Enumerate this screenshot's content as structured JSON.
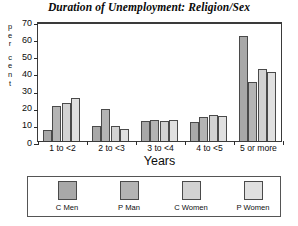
{
  "chart_data": {
    "type": "bar",
    "title": "Duration of Unemployment: Religion/Sex",
    "xlabel": "Years",
    "ylabel": "percent",
    "ylabel_letters": [
      "p",
      "e",
      "r",
      "",
      "c",
      "e",
      "n",
      "t"
    ],
    "categories": [
      "1 to <2",
      "2 to <3",
      "3 to <4",
      "4 to <5",
      "5 or more"
    ],
    "series": [
      {
        "name": "C Men",
        "color": "#a8a8a8",
        "values": [
          6.5,
          9.0,
          11.5,
          11.0,
          61.5
        ]
      },
      {
        "name": "P Men",
        "color": "#b4b4b4",
        "values": [
          20.5,
          18.5,
          12.0,
          14.0,
          34.5
        ]
      },
      {
        "name": "C Women",
        "color": "#d2d2d2",
        "values": [
          22.0,
          8.5,
          11.5,
          15.0,
          42.0
        ]
      },
      {
        "name": "P Women",
        "color": "#e0e0e0",
        "values": [
          25.0,
          7.0,
          12.0,
          14.5,
          40.0
        ]
      }
    ],
    "ylim": [
      0,
      70
    ],
    "yticks": [
      0,
      10,
      20,
      30,
      40,
      50,
      60,
      70
    ],
    "ytick_labels": [
      "0",
      "10",
      "20",
      "30",
      "40",
      "50",
      "60",
      "70"
    ],
    "grid": false,
    "legend_position": "bottom"
  },
  "legend": {
    "entries": [
      {
        "label": "C Men"
      },
      {
        "label": "P Man"
      },
      {
        "label": "C Women"
      },
      {
        "label": "P Women"
      }
    ]
  }
}
